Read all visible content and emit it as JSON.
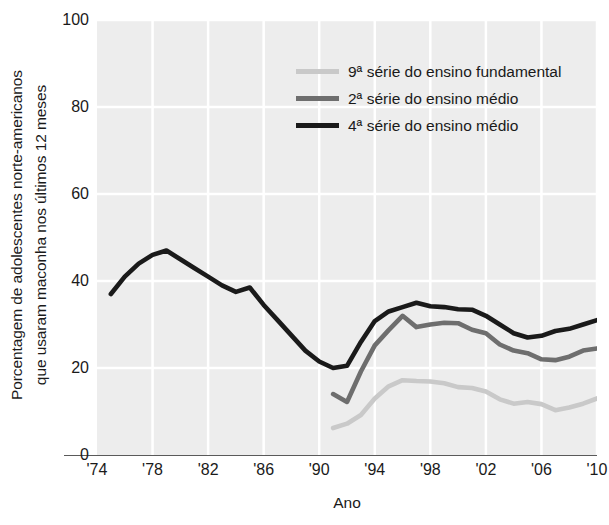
{
  "chart_data": {
    "type": "line",
    "title": "",
    "xlabel": "Ano",
    "ylabel": "Porcentagem de adolescentes norte-americanos que usaram maconha nos últimos 12 meses",
    "ylabel_line1": "Porcentagem de adolescentes norte-americanos",
    "ylabel_line2": "que usaram maconha nos últimos 12 meses",
    "xlim": [
      1974,
      2010
    ],
    "ylim": [
      0,
      100
    ],
    "grid": true,
    "legend_position": "top-right inside",
    "yticks": [
      0,
      20,
      40,
      60,
      80,
      100
    ],
    "ytick_labels": [
      "0",
      "20",
      "40",
      "60",
      "80",
      "100"
    ],
    "xticks": [
      1974,
      1978,
      1982,
      1986,
      1990,
      1994,
      1998,
      2002,
      2006,
      2010
    ],
    "xtick_labels": [
      "'74",
      "'78",
      "'82",
      "'86",
      "'90",
      "'94",
      "'98",
      "'02",
      "'06",
      "'10"
    ],
    "series": [
      {
        "name": "9ª série do ensino fundamental",
        "color": "#c9c9c9",
        "x": [
          1991,
          1992,
          1993,
          1994,
          1995,
          1996,
          1997,
          1998,
          1999,
          2000,
          2001,
          2002,
          2003,
          2004,
          2005,
          2006,
          2007,
          2008,
          2009,
          2010
        ],
        "values": [
          6.2,
          7.2,
          9.2,
          13.0,
          15.8,
          17.2,
          17.0,
          16.9,
          16.5,
          15.6,
          15.4,
          14.6,
          12.8,
          11.8,
          12.2,
          11.7,
          10.3,
          10.9,
          11.8,
          13.0
        ]
      },
      {
        "name": "2ª série do ensino médio",
        "color": "#6e6e6e",
        "x": [
          1991,
          1992,
          1993,
          1994,
          1995,
          1996,
          1997,
          1998,
          1999,
          2000,
          2001,
          2002,
          2003,
          2004,
          2005,
          2006,
          2007,
          2008,
          2009,
          2010
        ],
        "values": [
          14.0,
          12.2,
          19.2,
          25.2,
          28.7,
          32.0,
          29.4,
          30.0,
          30.4,
          30.3,
          28.8,
          28.0,
          25.4,
          24.0,
          23.4,
          22.0,
          21.8,
          22.6,
          24.0,
          24.5
        ]
      },
      {
        "name": "4ª série do ensino médio",
        "color": "#1a1a1a",
        "x": [
          1975,
          1976,
          1977,
          1978,
          1979,
          1980,
          1981,
          1982,
          1983,
          1984,
          1985,
          1986,
          1987,
          1988,
          1989,
          1990,
          1991,
          1992,
          1993,
          1994,
          1995,
          1996,
          1997,
          1998,
          1999,
          2000,
          2001,
          2002,
          2003,
          2004,
          2005,
          2006,
          2007,
          2008,
          2009,
          2010
        ],
        "values": [
          37.0,
          41.0,
          44.0,
          46.0,
          47.0,
          45.0,
          43.0,
          41.0,
          39.0,
          37.5,
          38.5,
          34.5,
          31.0,
          27.5,
          24.0,
          21.5,
          20.0,
          20.5,
          26.0,
          30.8,
          33.0,
          34.0,
          35.0,
          34.2,
          34.0,
          33.5,
          33.4,
          32.0,
          30.0,
          28.0,
          27.0,
          27.4,
          28.5,
          29.0,
          30.0,
          31.0
        ]
      }
    ]
  },
  "axes": {
    "x_axis_title": "Ano"
  },
  "legend": {
    "entries": [
      {
        "label": "9ª série do ensino fundamental",
        "color": "#c9c9c9"
      },
      {
        "label": "2ª série do ensino médio",
        "color": "#6e6e6e"
      },
      {
        "label": "4ª série do ensino médio",
        "color": "#1a1a1a"
      }
    ]
  },
  "colors": {
    "plot_background": "#ededed",
    "gridline": "#ffffff",
    "axis_rule": "#5a5a5a",
    "text": "#1a1a1a",
    "page_background": "#ffffff"
  }
}
